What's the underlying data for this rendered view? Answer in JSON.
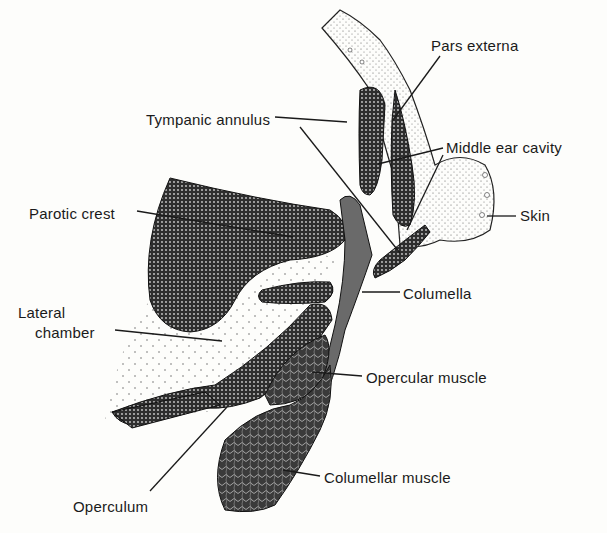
{
  "figure": {
    "type": "anatomical-diagram",
    "labels": [
      {
        "id": "pars-externa",
        "text": "Pars externa",
        "x": 431,
        "y": 37
      },
      {
        "id": "tympanic-annulus",
        "text": "Tympanic annulus",
        "x": 146,
        "y": 111
      },
      {
        "id": "middle-ear-cavity",
        "text": "Middle ear cavity",
        "x": 446,
        "y": 139
      },
      {
        "id": "parotic-crest",
        "text": "Parotic crest",
        "x": 29,
        "y": 205
      },
      {
        "id": "skin",
        "text": "Skin",
        "x": 520,
        "y": 207
      },
      {
        "id": "columella",
        "text": "Columella",
        "x": 403,
        "y": 285
      },
      {
        "id": "lateral-chamber-1",
        "text": "Lateral",
        "x": 18,
        "y": 304
      },
      {
        "id": "lateral-chamber-2",
        "text": "chamber",
        "x": 35,
        "y": 324
      },
      {
        "id": "opercular-muscle",
        "text": "Opercular muscle",
        "x": 366,
        "y": 369
      },
      {
        "id": "columellar-muscle",
        "text": "Columellar muscle",
        "x": 324,
        "y": 469
      },
      {
        "id": "operculum",
        "text": "Operculum",
        "x": 73,
        "y": 498
      }
    ],
    "colors": {
      "ink": "#1a1a1a",
      "paper": "#fdfdfb",
      "dark_tissue": "#3a3a3a",
      "stipple": "#d8d8d4"
    }
  }
}
